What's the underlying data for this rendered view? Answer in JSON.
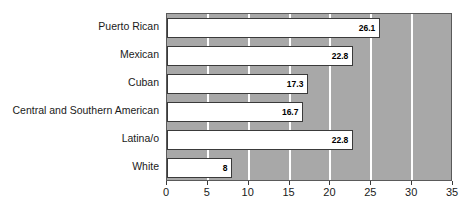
{
  "chart_data": {
    "type": "bar",
    "orientation": "horizontal",
    "title": "",
    "xlabel": "",
    "ylabel": "",
    "categories": [
      "Puerto Rican",
      "Mexican",
      "Cuban",
      "Central and Southern American",
      "Latina/o",
      "White"
    ],
    "values": [
      26.1,
      22.8,
      17.3,
      16.7,
      22.8,
      8
    ],
    "value_labels": [
      "26.1",
      "22.8",
      "17.3",
      "16.7",
      "22.8",
      "8"
    ],
    "xlim": [
      0,
      35
    ],
    "xticks": [
      0,
      5,
      10,
      15,
      20,
      25,
      30,
      35
    ],
    "xtick_labels": [
      "0",
      "5",
      "10",
      "15",
      "20",
      "25",
      "30",
      "35"
    ],
    "grid": true,
    "grid_orientation": "vertical",
    "legend": false,
    "legend_position": "none",
    "colors": {
      "plot_background": "#a8a8a8",
      "gridline": "#ffffff",
      "bar_fill": "#ffffff",
      "bar_border": "#3a3a3a",
      "text": "#1a1a1a",
      "page_background": "#ffffff"
    }
  }
}
